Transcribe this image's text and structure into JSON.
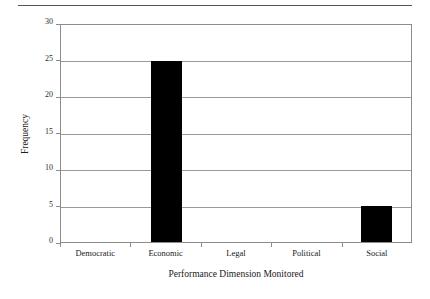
{
  "chart_data": {
    "type": "bar",
    "title": "",
    "subtitle": "",
    "xlabel": "Performance Dimension Monitored",
    "ylabel": "Frequency",
    "categories": [
      "Democratic",
      "Economic",
      "Legal",
      "Political",
      "Social"
    ],
    "values": [
      0,
      25,
      0,
      0,
      5
    ],
    "series": [
      {
        "name": "Frequency",
        "values": [
          0,
          25,
          0,
          0,
          5
        ]
      }
    ],
    "ylim": [
      0,
      30
    ],
    "yticks": [
      0,
      5,
      10,
      15,
      20,
      25,
      30
    ],
    "ytick_labels": [
      "0",
      "5",
      "10",
      "15",
      "20",
      "25",
      "30"
    ],
    "grid": "horizontal",
    "legend": "none",
    "bar_color": "#000000",
    "axis_color": "#8c8c8c",
    "gridline_color": "#9a9a9a",
    "background_color": "#ffffff",
    "annotations": []
  },
  "figure": {
    "top_rule": "horizontal-rule"
  }
}
